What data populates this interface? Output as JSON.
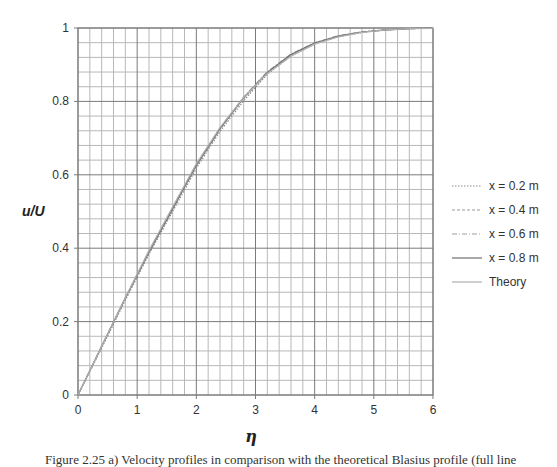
{
  "chart_data": {
    "type": "line",
    "title": "",
    "xlabel": "η",
    "ylabel": "u/U",
    "xlim": [
      0,
      6
    ],
    "ylim": [
      0,
      1
    ],
    "xticks": [
      "0",
      "1",
      "2",
      "3",
      "4",
      "5",
      "6"
    ],
    "yticks": [
      "0",
      "0.2",
      "0.4",
      "0.6",
      "0.8",
      "1"
    ],
    "grid": true,
    "grid_minor_x_step": 0.2,
    "grid_minor_y_step": 0.04,
    "legend_position": "right",
    "x": [
      0,
      0.4,
      0.8,
      1.2,
      1.6,
      2.0,
      2.4,
      2.8,
      3.2,
      3.6,
      4.0,
      4.4,
      4.8,
      5.2,
      5.6,
      6.0
    ],
    "series": [
      {
        "name": "x = 0.2 m",
        "style": "dotted",
        "color": "#8a8a8a",
        "values": [
          0,
          0.128,
          0.258,
          0.384,
          0.5,
          0.618,
          0.718,
          0.802,
          0.874,
          0.924,
          0.957,
          0.976,
          0.988,
          0.994,
          0.998,
          1.0
        ]
      },
      {
        "name": "x = 0.4 m",
        "style": "dashed",
        "color": "#9a9a9a",
        "values": [
          0,
          0.132,
          0.262,
          0.388,
          0.506,
          0.624,
          0.724,
          0.808,
          0.878,
          0.927,
          0.959,
          0.978,
          0.989,
          0.995,
          0.998,
          1.0
        ]
      },
      {
        "name": "x = 0.6 m",
        "style": "dash-dot",
        "color": "#a0a0a0",
        "values": [
          0,
          0.134,
          0.265,
          0.392,
          0.51,
          0.628,
          0.728,
          0.812,
          0.881,
          0.929,
          0.96,
          0.979,
          0.99,
          0.995,
          0.998,
          1.0
        ]
      },
      {
        "name": "x = 0.8 m",
        "style": "solid",
        "color": "#707070",
        "values": [
          0,
          0.133,
          0.264,
          0.39,
          0.508,
          0.626,
          0.726,
          0.81,
          0.879,
          0.928,
          0.959,
          0.978,
          0.989,
          0.995,
          0.998,
          1.0
        ]
      },
      {
        "name": "Theory",
        "style": "solid",
        "color": "#b0b0b0",
        "values": [
          0,
          0.133,
          0.265,
          0.394,
          0.513,
          0.63,
          0.729,
          0.811,
          0.876,
          0.923,
          0.956,
          0.976,
          0.988,
          0.995,
          0.998,
          0.999
        ]
      }
    ]
  },
  "axes": {
    "y_title": "u/U",
    "x_title": "η"
  },
  "legend": [
    {
      "label": "x = 0.2 m"
    },
    {
      "label": "x = 0.4 m"
    },
    {
      "label": "x = 0.6 m"
    },
    {
      "label": "x = 0.8 m"
    },
    {
      "label": "Theory"
    }
  ],
  "caption": "Figure 2.25 a) Velocity profiles in comparison with the theoretical Blasius profile (full line"
}
